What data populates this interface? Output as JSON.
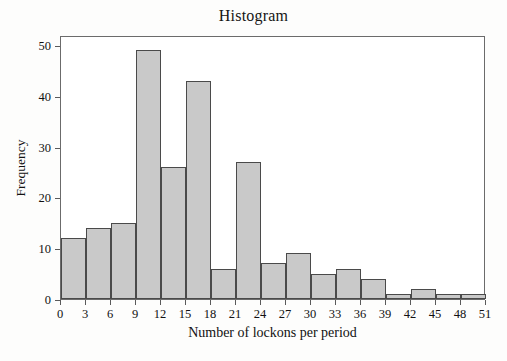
{
  "chart_data": {
    "type": "bar",
    "title": "Histogram",
    "xlabel": "Number of lockons per period",
    "ylabel": "Frequency",
    "grid": false,
    "legend": null,
    "bin_width": 3,
    "xlim": [
      0,
      51
    ],
    "ylim": [
      0,
      52
    ],
    "xticks": [
      0,
      3,
      6,
      9,
      12,
      15,
      18,
      21,
      24,
      27,
      30,
      33,
      36,
      39,
      42,
      45,
      48,
      51
    ],
    "yticks": [
      0,
      10,
      20,
      30,
      40,
      50
    ],
    "bin_edges": [
      0,
      3,
      6,
      9,
      12,
      15,
      18,
      21,
      24,
      27,
      30,
      33,
      36,
      39,
      42,
      45,
      48,
      51
    ],
    "categories": [
      "0-3",
      "3-6",
      "6-9",
      "9-12",
      "12-15",
      "15-18",
      "18-21",
      "21-24",
      "24-27",
      "27-30",
      "30-33",
      "33-36",
      "36-39",
      "39-42",
      "42-45",
      "45-48",
      "48-51"
    ],
    "values": [
      12,
      14,
      15,
      49,
      26,
      43,
      6,
      27,
      7,
      9,
      5,
      6,
      4,
      1,
      2,
      1,
      1
    ],
    "bar_fill_color": "#c9c9c9",
    "bar_edge_color": "#4a4a4a",
    "frame_color": "#6b6b6b",
    "background_color": "#ffffff"
  }
}
